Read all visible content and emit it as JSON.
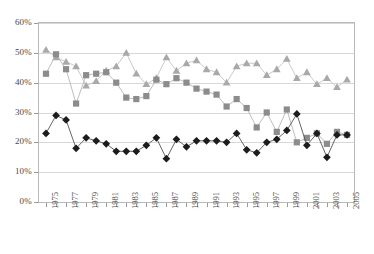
{
  "chart_data": {
    "type": "line",
    "title": "",
    "xlabel": "",
    "ylabel": "",
    "ylim": [
      0,
      60
    ],
    "ytick_labels": [
      "0%",
      "10%",
      "20%",
      "30%",
      "40%",
      "50%",
      "60%"
    ],
    "ytick_values": [
      0,
      10,
      20,
      30,
      40,
      50,
      60
    ],
    "grid": true,
    "legend_position": "none",
    "x": [
      1975,
      1976,
      1977,
      1978,
      1979,
      1980,
      1981,
      1982,
      1983,
      1984,
      1985,
      1986,
      1987,
      1988,
      1989,
      1990,
      1991,
      1992,
      1993,
      1994,
      1995,
      1996,
      1997,
      1998,
      1999,
      2000,
      2001,
      2002,
      2003,
      2004,
      2005
    ],
    "xtick_labels": [
      "1975",
      "1977",
      "1979",
      "1981",
      "1983",
      "1985",
      "1987",
      "1989",
      "1991",
      "1993",
      "1995",
      "1997",
      "1999",
      "2001",
      "2003",
      "2005"
    ],
    "xtick_values": [
      1975,
      1977,
      1979,
      1981,
      1983,
      1985,
      1987,
      1989,
      1991,
      1993,
      1995,
      1997,
      1999,
      2001,
      2003,
      2005
    ],
    "series": [
      {
        "name": "triangle-series",
        "marker": "triangle",
        "color": "#a9a9a9",
        "line_color": "#c4c4c4",
        "values": [
          51.0,
          48.5,
          47.0,
          45.5,
          39.0,
          40.5,
          44.0,
          45.5,
          50.0,
          43.0,
          39.5,
          41.5,
          48.5,
          44.0,
          46.5,
          47.5,
          44.5,
          43.5,
          40.0,
          45.5,
          46.5,
          46.5,
          42.5,
          44.5,
          48.0,
          41.5,
          43.5,
          39.5,
          41.5,
          38.5,
          41.0
        ]
      },
      {
        "name": "square-series",
        "marker": "square",
        "color": "#8c8c8c",
        "line_color": "#b5b5b5",
        "values": [
          43.0,
          49.5,
          44.5,
          33.0,
          42.5,
          43.0,
          43.5,
          40.0,
          35.0,
          34.5,
          35.5,
          41.0,
          39.5,
          41.5,
          40.0,
          38.0,
          37.0,
          36.0,
          32.0,
          34.5,
          31.5,
          25.0,
          30.0,
          23.5,
          31.0,
          20.0,
          21.5,
          23.0,
          19.5,
          23.5,
          22.5
        ]
      },
      {
        "name": "diamond-series",
        "marker": "diamond",
        "color": "#1c1c1c",
        "line_color": "#555555",
        "values": [
          23.0,
          29.0,
          27.5,
          18.0,
          21.5,
          20.5,
          19.5,
          17.0,
          17.0,
          17.0,
          19.0,
          21.5,
          14.5,
          21.0,
          18.5,
          20.5,
          20.5,
          20.5,
          20.0,
          23.0,
          17.5,
          16.5,
          20.0,
          21.0,
          24.0,
          29.5,
          19.0,
          23.0,
          15.0,
          22.5,
          22.5
        ]
      }
    ]
  }
}
